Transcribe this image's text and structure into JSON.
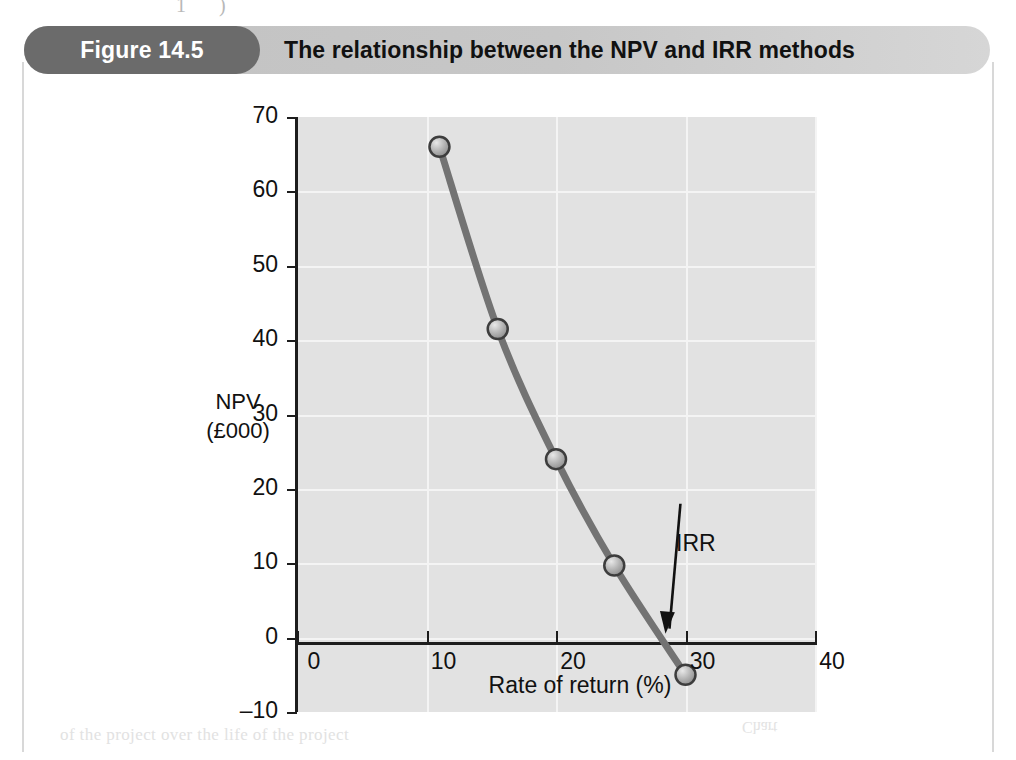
{
  "header": {
    "figure_number": "Figure 14.5",
    "title": "The relationship between the NPV and IRR methods",
    "pill_color": "#6b6b6b",
    "banner_color": "#c7c7c7"
  },
  "artifacts": {
    "top": "1 )",
    "bottom": "of the project over the life of the project",
    "right": "Chart"
  },
  "chart_data": {
    "type": "line",
    "title": "The relationship between the NPV and IRR methods",
    "xlabel": "Rate of return (%)",
    "ylabel": "NPV\n(£000)",
    "ylabel_line1": "NPV",
    "ylabel_line2": "(£000)",
    "xlim": [
      0,
      40
    ],
    "ylim": [
      -10,
      70
    ],
    "xticks": [
      0,
      10,
      20,
      30,
      40
    ],
    "xtick_labels": [
      "0",
      "10",
      "20",
      "30",
      "40"
    ],
    "yticks": [
      -10,
      0,
      10,
      20,
      30,
      40,
      50,
      60,
      70
    ],
    "ytick_labels": [
      "-10",
      "0",
      "10",
      "20",
      "30",
      "40",
      "50",
      "60",
      "70"
    ],
    "grid": true,
    "legend": "none",
    "series": [
      {
        "name": "NPV",
        "line_color": "#737373",
        "marker_color": "#b0b0b0",
        "marker_edge_color": "#3d3d3d",
        "x": [
          11,
          15.5,
          20,
          24.5,
          30
        ],
        "values": [
          66,
          41.5,
          24,
          9.7,
          -5
        ]
      }
    ],
    "annotations": [
      {
        "text": "IRR",
        "x": 28.3,
        "y": 0,
        "label_x": 29.3,
        "label_y": 18,
        "arrow": true
      }
    ],
    "plot_bg_color": "#e2e2e2",
    "gridline_color": "#f4f4f4",
    "axis_color": "#1d1d1d"
  }
}
